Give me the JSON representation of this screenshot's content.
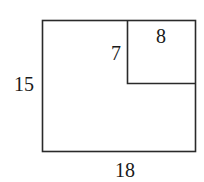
{
  "diagram": {
    "type": "geometry-figure",
    "outer_rectangle": {
      "width_label": "18",
      "height_label": "15"
    },
    "inner_rectangle": {
      "width_label": "8",
      "height_label": "7"
    },
    "stroke_color": "#2a2a2a",
    "background_color": "#ffffff"
  }
}
